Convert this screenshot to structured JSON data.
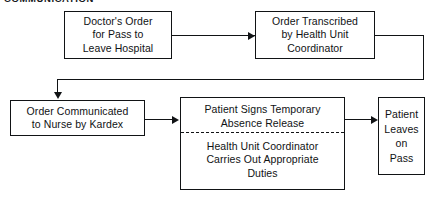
{
  "figure": {
    "type": "flowchart",
    "orientation": "left-to-right",
    "heading_clipped": "COMMUNICATION",
    "background_color": "#ffffff",
    "line_color": "#111315",
    "text_color": "#101214"
  },
  "nodes": {
    "doctors_order": {
      "id": "doctors-order",
      "lines": [
        "Doctor's Order",
        "for Pass to",
        "Leave Hospital"
      ]
    },
    "order_transcribed": {
      "id": "order-transcribed",
      "lines": [
        "Order Transcribed",
        "by Health Unit",
        "Coordinator"
      ]
    },
    "order_communicated": {
      "id": "order-communicated",
      "lines": [
        "Order Communicated",
        "to Nurse by Kardex"
      ]
    },
    "patient_signs": {
      "id": "patient-signs-and-duties",
      "top_lines": [
        "Patient Signs Temporary",
        "Absence Release"
      ],
      "bottom_lines": [
        "Health Unit Coordinator",
        "Carries Out Appropriate",
        "Duties"
      ],
      "divider_style": "dashed"
    },
    "patient_leaves": {
      "id": "patient-leaves-on-pass",
      "lines": [
        "Patient",
        "Leaves",
        "on",
        "Pass"
      ]
    }
  },
  "connectors": [
    {
      "id": "doctors-order-to-order-transcribed",
      "from": "doctors_order",
      "to": "order_transcribed",
      "shape": "straight-horizontal",
      "arrow": "right"
    },
    {
      "id": "order-transcribed-to-order-communicated",
      "from": "order_transcribed",
      "to": "order_communicated",
      "shape": "right-down-left-down",
      "arrow": "down"
    },
    {
      "id": "order-communicated-to-patient-signs",
      "from": "order_communicated",
      "to": "patient_signs",
      "shape": "straight-horizontal",
      "arrow": "right"
    },
    {
      "id": "patient-signs-to-patient-leaves",
      "from": "patient_signs",
      "to": "patient_leaves",
      "shape": "straight-horizontal",
      "arrow": "right"
    }
  ]
}
